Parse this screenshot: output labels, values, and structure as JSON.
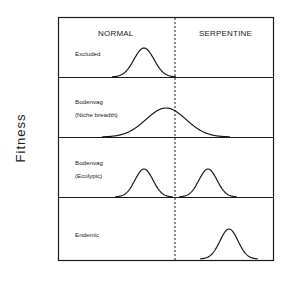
{
  "figure": {
    "y_axis_label": "Fitness",
    "column_headers": {
      "left": "NORMAL",
      "right": "SERPENTINE"
    },
    "rows": [
      {
        "label_line1": "Excluded",
        "label_line2": "",
        "peaks": [
          {
            "x": 144,
            "width": 10,
            "height": 29
          }
        ]
      },
      {
        "label_line1": "Bodenvag",
        "label_line2": "(Niche breadth)",
        "peaks": [
          {
            "x": 166,
            "width": 20,
            "height": 29
          }
        ]
      },
      {
        "label_line1": "Bodenvag",
        "label_line2": "(Ecolypic)",
        "peaks": [
          {
            "x": 144,
            "width": 9,
            "height": 28
          },
          {
            "x": 208,
            "width": 9,
            "height": 28
          }
        ]
      },
      {
        "label_line1": "Endemic",
        "label_line2": "",
        "peaks": [
          {
            "x": 229,
            "width": 9,
            "height": 30
          }
        ]
      }
    ],
    "colors": {
      "line": "#1a1a1a",
      "background": "#ffffff"
    }
  }
}
